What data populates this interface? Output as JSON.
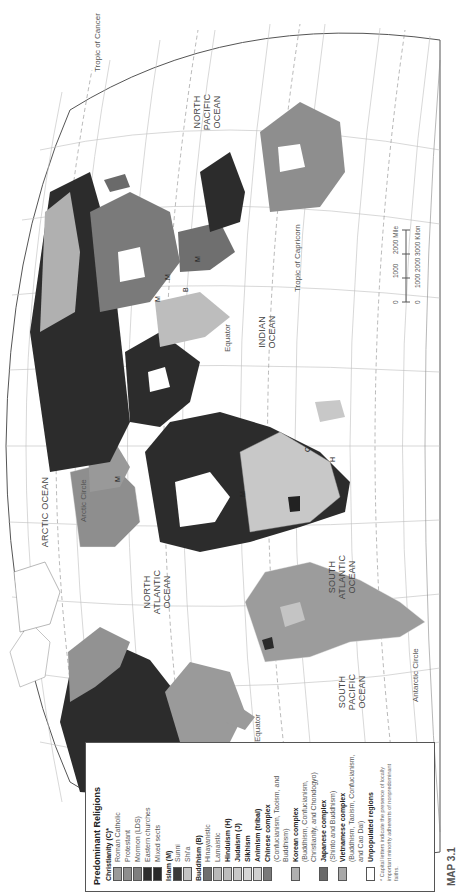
{
  "map": {
    "title": "Predominant Religions",
    "map_number": "MAP 3.1",
    "orientation": "rotated 90° counter-clockwise",
    "colors": {
      "background": "#ffffff",
      "graticule": "#b8b8b8",
      "border": "#555555",
      "roman_catholic": "#9a9a9a",
      "protestant": "#8e8e8e",
      "mormon": "#7f7f7f",
      "eastern_churches": "#2e2e2e",
      "mixed_sects": "#2a2a2a",
      "sunni": "#3a3a3a",
      "shia": "#c4c4c4",
      "hinayanistic": "#6f6f6f",
      "lamaistic": "#b8b8b8",
      "hinduism": "#bdbdbd",
      "judaism": "#c8c8c8",
      "sikhism": "#d6d6d6",
      "animism": "#cfcfcf",
      "chinese": "#7a7a7a",
      "korean": "#b0b0b0",
      "japanese": "#6a6a6a",
      "vietnamese": "#a8a8a8",
      "unpopulated": "#ffffff"
    },
    "ocean_labels": [
      {
        "text": [
          "NORTH",
          "PACIFIC",
          "OCEAN"
        ]
      },
      {
        "text": [
          "NORTH",
          "ATLANTIC",
          "OCEAN"
        ]
      },
      {
        "text": [
          "SOUTH",
          "PACIFIC",
          "OCEAN"
        ]
      },
      {
        "text": [
          "SOUTH",
          "ATLANTIC",
          "OCEAN"
        ]
      },
      {
        "text": [
          "INDIAN",
          "OCEAN"
        ]
      },
      {
        "text": [
          "ARCTIC OCEAN"
        ]
      }
    ],
    "line_labels": {
      "arctic_circle": "Arctic Circle",
      "antarctic_circle": "Antarctic Circle",
      "tropic_cancer": "Tropic of Cancer",
      "tropic_capricorn": "Tropic of Capricorn",
      "equator_1": "Equator",
      "equator_2": "Equator"
    },
    "minority_letters": [
      "M",
      "B",
      "M",
      "M",
      "M",
      "H",
      "M",
      "C"
    ],
    "scale": {
      "miles_ticks": [
        "0",
        "1000",
        "2000 Miles"
      ],
      "km_ticks": [
        "0",
        "1000",
        "2000",
        "3000 Kilometers"
      ]
    }
  },
  "legend": {
    "title": "Predominant Religions",
    "groups": [
      {
        "name": "Christianity (C)*",
        "items": [
          {
            "label": "Roman Catholic",
            "color": "#9a9a9a"
          },
          {
            "label": "Protestant",
            "color": "#8e8e8e"
          },
          {
            "label": "Mormon (LDS)",
            "color": "#7f7f7f"
          },
          {
            "label": "Eastern churches",
            "color": "#2e2e2e"
          },
          {
            "label": "Mixed sects",
            "color": "#2a2a2a"
          }
        ]
      },
      {
        "name": "Islam (M)",
        "items": [
          {
            "label": "Sunni",
            "color": "#3a3a3a"
          },
          {
            "label": "Shi'a",
            "color": "#c4c4c4"
          }
        ]
      },
      {
        "name": "Buddhism (B)",
        "items": [
          {
            "label": "Hinayanistic",
            "color": "#6f6f6f"
          },
          {
            "label": "Lamaistic",
            "color": "#b8b8b8"
          }
        ]
      }
    ],
    "singles": [
      {
        "label": "Hinduism (H)",
        "color": "#bdbdbd"
      },
      {
        "label": "Judaism (J)",
        "color": "#c8c8c8"
      },
      {
        "label": "Sikhism",
        "color": "#d6d6d6"
      },
      {
        "label": "Animism (tribal)",
        "color": "#cfcfcf"
      },
      {
        "label": "Chinese complex",
        "sub": "(Confucianism, Taoism, and Buddhism)",
        "color": "#7a7a7a"
      },
      {
        "label": "Korean complex",
        "sub": "(Buddhism, Confucianism, Christianity, and Chondogyo)",
        "color": "#b0b0b0"
      },
      {
        "label": "Japanese complex",
        "sub": "(Shinto and Buddhism)",
        "color": "#6a6a6a"
      },
      {
        "label": "Vietnamese complex",
        "sub": "(Buddhism, Taoism, Confucianism, and Cao Dai)",
        "color": "#a8a8a8"
      },
      {
        "label": "Unpopulated regions",
        "color": "#ffffff"
      }
    ],
    "note": "* Capital letters indicate the presence of locally important minority adherents of nonpredominant faiths."
  }
}
